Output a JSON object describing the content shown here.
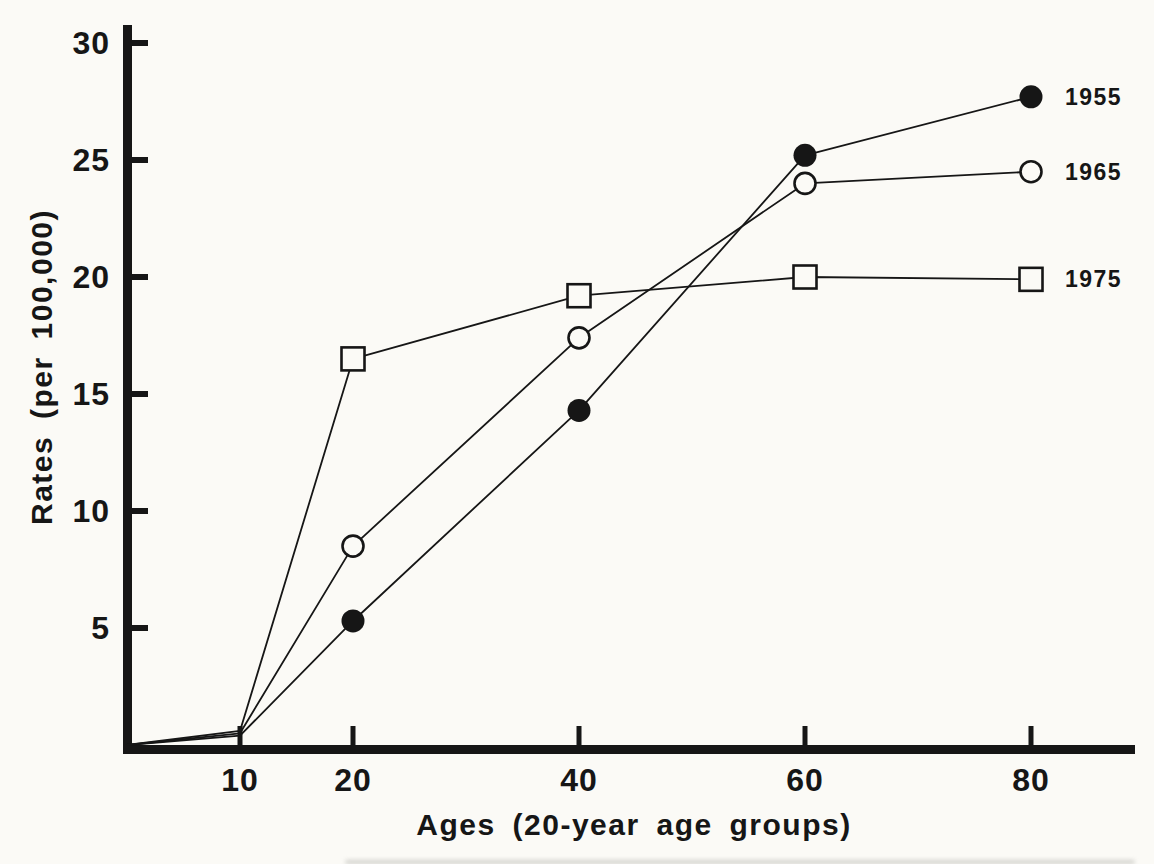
{
  "figure": {
    "background": "#fbfaf6",
    "ink_color": "#161616"
  },
  "chart_data": {
    "type": "line",
    "title": "",
    "xlabel": "Ages (20-year age groups)",
    "ylabel": "Rates (per 100,000)",
    "x_ticks": [
      10,
      20,
      40,
      60,
      80
    ],
    "y_ticks": [
      5,
      10,
      15,
      20,
      25,
      30
    ],
    "xlim": [
      0,
      89
    ],
    "ylim": [
      0,
      30.8
    ],
    "grid": false,
    "legend_position": "right-of-last-point",
    "marker_min_age": 20,
    "series": [
      {
        "name": "1955",
        "marker": "filled-circle",
        "points": [
          {
            "age": 0,
            "rate": 0
          },
          {
            "age": 10,
            "rate": 0.4
          },
          {
            "age": 20,
            "rate": 5.3
          },
          {
            "age": 40,
            "rate": 14.3
          },
          {
            "age": 60,
            "rate": 25.2
          },
          {
            "age": 80,
            "rate": 27.7
          }
        ]
      },
      {
        "name": "1965",
        "marker": "open-circle",
        "points": [
          {
            "age": 0,
            "rate": 0
          },
          {
            "age": 10,
            "rate": 0.5
          },
          {
            "age": 20,
            "rate": 8.5
          },
          {
            "age": 40,
            "rate": 17.4
          },
          {
            "age": 60,
            "rate": 24.0
          },
          {
            "age": 80,
            "rate": 24.5
          }
        ]
      },
      {
        "name": "1975",
        "marker": "open-square",
        "points": [
          {
            "age": 0,
            "rate": 0
          },
          {
            "age": 10,
            "rate": 0.6
          },
          {
            "age": 20,
            "rate": 16.5
          },
          {
            "age": 40,
            "rate": 19.2
          },
          {
            "age": 60,
            "rate": 20.0
          },
          {
            "age": 80,
            "rate": 19.9
          }
        ]
      }
    ]
  }
}
